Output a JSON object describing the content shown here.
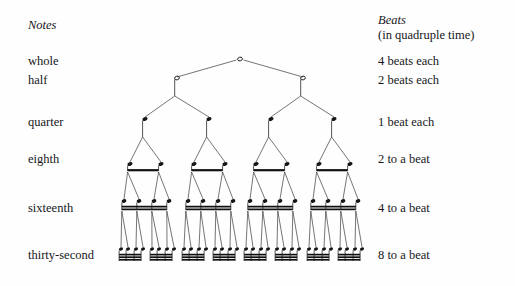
{
  "page": {
    "background": "#fefefe",
    "ink": "#16161a",
    "width": 515,
    "height": 286
  },
  "columns": {
    "notes_header": "Notes",
    "beats_header": "Beats",
    "beats_subheader": "(in quadruple time)"
  },
  "rows": [
    {
      "name": "whole",
      "label": "whole",
      "beats": "4 beats each",
      "label_y": 61,
      "beats_y": 61,
      "count": 1,
      "glyph": "open-notehead-no-stem"
    },
    {
      "name": "half",
      "label": "half",
      "beats": "2 beats each",
      "label_y": 80,
      "beats_y": 80,
      "count": 2,
      "glyph": "open-notehead-stem"
    },
    {
      "name": "quarter",
      "label": "quarter",
      "beats": "1 beat each",
      "label_y": 122,
      "beats_y": 122,
      "count": 4,
      "glyph": "solid-notehead-stem"
    },
    {
      "name": "eighth",
      "label": "eighth",
      "beats": "2 to a beat",
      "label_y": 159,
      "beats_y": 159,
      "count": 8,
      "glyph": "beamed-1"
    },
    {
      "name": "sixteenth",
      "label": "sixteenth",
      "beats": "4 to a beat",
      "label_y": 208,
      "beats_y": 208,
      "count": 16,
      "glyph": "beamed-2"
    },
    {
      "name": "thirty-second",
      "label": "thirty-second",
      "beats": "8 to a beat",
      "label_y": 255,
      "beats_y": 255,
      "count": 32,
      "glyph": "beamed-3"
    }
  ],
  "diagram": {
    "type": "note-value-binary-tree",
    "levels": 6,
    "whole": {
      "y": 59,
      "x": [
        240
      ]
    },
    "half": {
      "y": 78,
      "x": [
        177,
        303
      ]
    },
    "quarter": {
      "y": 119,
      "x": [
        145,
        209,
        271,
        334
      ]
    },
    "eighth": {
      "y": 164,
      "beam_y": 171,
      "x": [
        130,
        161,
        194,
        225,
        256,
        287,
        319,
        350
      ]
    },
    "sixteenth": {
      "y": 201,
      "beam_y": 206,
      "x": [
        124,
        139,
        154,
        169,
        188,
        203,
        218,
        233,
        250,
        265,
        280,
        295,
        313,
        328,
        343,
        358
      ]
    },
    "thirtysecond": {
      "y": 249,
      "beam_y": 254,
      "x": [
        121,
        128,
        136,
        143,
        152,
        159,
        167,
        174,
        184,
        191,
        199,
        206,
        215,
        222,
        230,
        237,
        246,
        253,
        261,
        268,
        277,
        284,
        292,
        299,
        309,
        316,
        324,
        331,
        340,
        347,
        355,
        362
      ]
    }
  }
}
